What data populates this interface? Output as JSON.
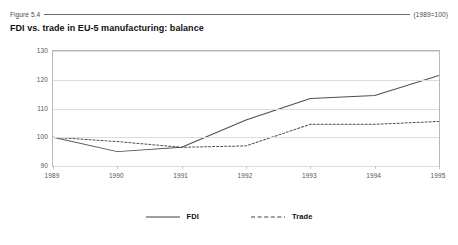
{
  "figure": {
    "number": "Figure 5.4",
    "index_note": "(1989=100)",
    "title": "FDI vs. trade in EU-5 manufacturing: balance"
  },
  "legend": {
    "fdi_label": "FDI",
    "trade_label": "Trade"
  },
  "chart_data": {
    "type": "line",
    "title": "FDI vs. trade in EU-5 manufacturing: balance",
    "subtitle": "(1989=100)",
    "xlabel": "",
    "ylabel": "",
    "categories": [
      "1989",
      "1990",
      "1991",
      "1992",
      "1993",
      "1994",
      "1995"
    ],
    "x": [
      1989,
      1990,
      1991,
      1992,
      1993,
      1994,
      1995
    ],
    "ylim": [
      90,
      130
    ],
    "yticks": [
      90,
      100,
      110,
      120,
      130
    ],
    "grid": true,
    "legend_position": "bottom",
    "series": [
      {
        "name": "FDI",
        "style": "solid",
        "color": "#4d4d4d",
        "values": [
          100,
          95,
          96.5,
          106,
          113.5,
          114.5,
          121.5
        ]
      },
      {
        "name": "Trade",
        "style": "dashed",
        "color": "#4d4d4d",
        "values": [
          100,
          98.5,
          96.5,
          97,
          104.5,
          104.5,
          105.5
        ]
      }
    ]
  }
}
